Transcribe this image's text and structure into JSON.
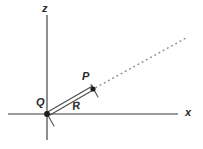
{
  "figure": {
    "type": "geometry-diagram",
    "width": 203,
    "height": 149,
    "background_color": "#ffffff",
    "axes": {
      "vertical": {
        "name": "z-axis",
        "label": "z",
        "x": 47,
        "y_top": 15,
        "y_bottom": 140,
        "color": "#3b3b3b"
      },
      "horizontal": {
        "name": "x-axis",
        "label": "x",
        "y": 114,
        "x_left": 8,
        "x_right": 178,
        "color": "#3b3b3b"
      }
    },
    "points": [
      {
        "label": "Q",
        "x": 47,
        "y": 114,
        "label_x": 36,
        "label_y": 97
      },
      {
        "label": "P",
        "x": 93,
        "y": 89,
        "label_x": 82,
        "label_y": 71
      }
    ],
    "vector": {
      "name": "R",
      "label": "R",
      "label_x": 72,
      "label_y": 100,
      "from": "Q",
      "to": "P",
      "color": "#4a4a4a"
    },
    "ray": {
      "name": "extension-ray",
      "style": "dotted",
      "from_x": 95,
      "from_y": 88,
      "to_x": 186,
      "to_y": 38,
      "color": "#8a8a8a"
    }
  }
}
